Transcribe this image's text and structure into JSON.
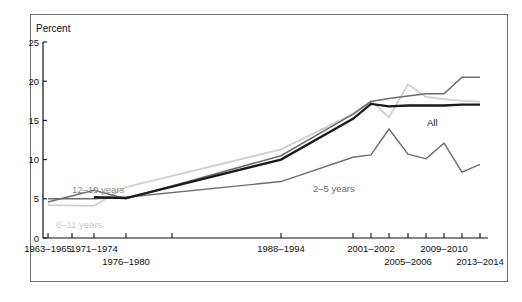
{
  "chart_data": {
    "type": "line",
    "title": "",
    "xlabel": "",
    "ylabel": "Percent",
    "unit_label": "Percent",
    "ylim": [
      0,
      25
    ],
    "yticks": [
      0,
      5,
      10,
      15,
      20,
      25
    ],
    "ytick_labels": [
      "0",
      "5",
      "10",
      "15",
      "20",
      "25"
    ],
    "grid": false,
    "legend_position": "inline-annotations",
    "categories": [
      "1963-1965",
      "1971-1974",
      "1976-1980",
      "1988-1994",
      "2001-2002",
      "2003-2004",
      "2005-2006",
      "2007-2008",
      "2009-2010",
      "2011-2012",
      "2013-2014"
    ],
    "xtick_labels": [
      {
        "text": "1963–1965",
        "x": 48,
        "row": 0
      },
      {
        "text": "1971–1974",
        "x": 94,
        "row": 0
      },
      {
        "text": "1976–1980",
        "x": 126,
        "row": 1
      },
      {
        "text": "1988–1994",
        "x": 281,
        "row": 0
      },
      {
        "text": "2001–2002",
        "x": 371,
        "row": 0
      },
      {
        "text": "2005–2006",
        "x": 408,
        "row": 1
      },
      {
        "text": "2009–2010",
        "x": 444,
        "row": 0
      },
      {
        "text": "2013–2014",
        "x": 480,
        "row": 1
      }
    ],
    "xtick_positions": [
      48,
      72,
      94,
      126,
      172,
      281,
      353,
      371,
      389,
      408,
      426,
      444,
      462,
      480
    ],
    "series": [
      {
        "name": "All",
        "label": "All",
        "color": "#1a1a1a",
        "width": 2.3,
        "x": [
          94,
          126,
          281,
          353,
          371,
          389,
          408,
          426,
          444,
          462,
          480
        ],
        "values": [
          5.2,
          5.1,
          10.0,
          15.2,
          17.1,
          16.8,
          16.9,
          16.9,
          16.9,
          17.0,
          17.0
        ]
      },
      {
        "name": "12-19 years",
        "label": "12–19 years",
        "color": "#6d6d6d",
        "width": 1.5,
        "x": [
          48,
          94,
          126,
          281,
          353,
          371,
          389,
          408,
          426,
          444,
          462,
          480
        ],
        "values": [
          4.6,
          6.1,
          5.0,
          10.5,
          15.8,
          17.4,
          17.8,
          18.1,
          18.4,
          18.4,
          20.5,
          20.5
        ]
      },
      {
        "name": "6-11 years",
        "label": "6–11 years",
        "color": "#cfcfcf",
        "width": 1.8,
        "x": [
          48,
          94,
          126,
          281,
          353,
          371,
          389,
          408,
          426,
          444,
          462,
          480
        ],
        "values": [
          4.2,
          4.1,
          6.5,
          11.3,
          15.8,
          17.5,
          15.4,
          19.6,
          18.0,
          17.7,
          17.5,
          17.4
        ]
      },
      {
        "name": "2-5 years",
        "label": "2–5 years",
        "color": "#6d6d6d",
        "width": 1.4,
        "x": [
          48,
          94,
          126,
          281,
          353,
          371,
          389,
          408,
          426,
          444,
          462,
          480
        ],
        "values": [
          5.0,
          5.0,
          5.2,
          7.2,
          10.3,
          10.6,
          13.9,
          10.7,
          10.1,
          12.1,
          8.4,
          9.4
        ]
      }
    ],
    "annotations": [
      {
        "text": "12–19 years",
        "x": 72,
        "y": 193,
        "color": "#8a8a8a",
        "anchor": "start"
      },
      {
        "text": "6–11 years",
        "x": 56,
        "y": 228,
        "color": "#cdcdcd",
        "anchor": "start"
      },
      {
        "text": "2–5 years",
        "x": 313,
        "y": 192,
        "color": "#6d6d6d",
        "anchor": "start"
      },
      {
        "text": "All",
        "x": 427,
        "y": 126,
        "color": "#111111",
        "anchor": "start"
      }
    ],
    "caption": ""
  },
  "colors": {
    "all": "#1a1a1a",
    "teens": "#6d6d6d",
    "children": "#cfcfcf",
    "toddlers": "#6d6d6d",
    "axis": "#111111",
    "frame": "#6e6e6e"
  }
}
